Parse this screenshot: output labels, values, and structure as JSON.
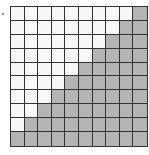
{
  "diagram": {
    "type": "shaded-grid",
    "rows": 10,
    "cols": 10,
    "shaded_per_row": [
      1,
      2,
      3,
      4,
      5,
      6,
      7,
      8,
      9,
      10
    ],
    "shaded_total": 55,
    "total_cells": 100,
    "colors": {
      "shaded": "#b4b4b4",
      "unshaded": "#f7f7f7",
      "lines": "#333333"
    }
  }
}
